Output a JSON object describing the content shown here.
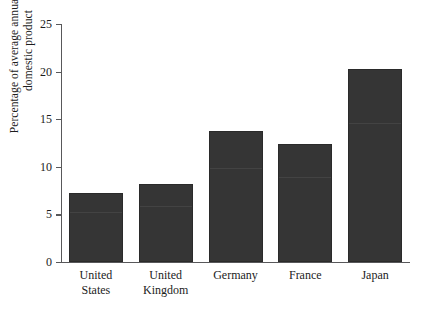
{
  "chart_data": {
    "type": "bar",
    "title": "",
    "xlabel": "",
    "ylabel": "Percentage of average annual gross\ndomestic product",
    "ylim": [
      0,
      25
    ],
    "yticks": [
      0,
      5,
      10,
      15,
      20,
      25
    ],
    "ytick_labels": [
      "0",
      "5",
      "10",
      "15",
      "20",
      "25"
    ],
    "grid": false,
    "legend": null,
    "categories": [
      "United\nStates",
      "United\nKingdom",
      "Germany",
      "France",
      "Japan"
    ],
    "category_names": [
      "United States",
      "United Kingdom",
      "Germany",
      "France",
      "Japan"
    ],
    "values": [
      7.3,
      8.2,
      13.8,
      12.4,
      20.3
    ],
    "bar_color": "#353535",
    "axis_color": "#58585a",
    "background_color": "#ffffff"
  }
}
